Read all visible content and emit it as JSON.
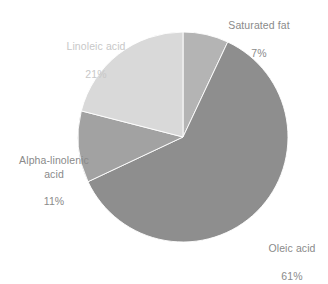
{
  "chart_data": {
    "type": "pie",
    "title": "",
    "subtitle": "",
    "xlabel": "",
    "ylabel": "",
    "legend_position": "none",
    "grid": false,
    "label_format": "name + percent",
    "start_angle_deg": 0,
    "direction": "clockwise",
    "categories": [
      "Saturated fat",
      "Oleic acid",
      "Alpha-linolenic acid",
      "Linoleic acid"
    ],
    "values": [
      7,
      61,
      11,
      21
    ],
    "units": "percent",
    "slices": [
      {
        "name": "Saturated fat",
        "name_display": "Saturated fat",
        "value": 7,
        "value_label": "7%",
        "color": "#b4b4b4",
        "start_deg": 0,
        "end_deg": 25.2,
        "label_position": "top-right"
      },
      {
        "name": "Oleic acid",
        "name_display": "Oleic acid",
        "value": 61,
        "value_label": "61%",
        "color": "#8e8e8e",
        "start_deg": 25.2,
        "end_deg": 244.8,
        "label_position": "bottom-right"
      },
      {
        "name": "Alpha-linolenic acid",
        "name_display": "Alpha-linolenic\nacid",
        "value": 11,
        "value_label": "11%",
        "color": "#a2a2a2",
        "start_deg": 244.8,
        "end_deg": 284.4,
        "label_position": "left"
      },
      {
        "name": "Linoleic acid",
        "name_display": "Linoleic acid",
        "value": 21,
        "value_label": "21%",
        "color": "#d9d9d9",
        "start_deg": 284.4,
        "end_deg": 360,
        "label_position": "top-left"
      }
    ],
    "geometry": {
      "center_x": 183,
      "center_y": 137,
      "radius": 105
    },
    "colors": {
      "background": "#ffffff",
      "label_text": "#8a8a8a",
      "label_text_light": "#c8c8c8",
      "slice_divider": "#ffffff"
    }
  }
}
